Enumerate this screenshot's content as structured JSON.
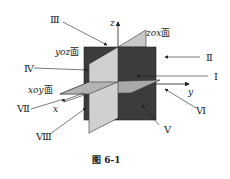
{
  "figure": {
    "caption": "图 6-1",
    "planes": {
      "yoz": {
        "label": "yoz面",
        "color": "#3c3c3c"
      },
      "zox": {
        "label": "zox面",
        "color": "#c8c8c8"
      },
      "xoy": {
        "label": "xoy面",
        "color": "#a9a9a9"
      }
    },
    "axes": {
      "x": "x",
      "y": "y",
      "z": "z"
    },
    "octants": [
      {
        "numeral": "Ⅰ"
      },
      {
        "numeral": "Ⅱ"
      },
      {
        "numeral": "Ⅲ"
      },
      {
        "numeral": "Ⅳ"
      },
      {
        "numeral": "Ⅴ"
      },
      {
        "numeral": "Ⅵ"
      },
      {
        "numeral": "Ⅶ"
      },
      {
        "numeral": "Ⅷ"
      }
    ]
  }
}
